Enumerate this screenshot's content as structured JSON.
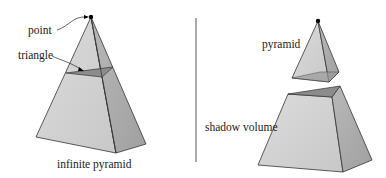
{
  "left_panel": {
    "labels": {
      "point": "point",
      "triangle": "triangle",
      "caption": "infinite pyramid"
    }
  },
  "right_panel": {
    "labels": {
      "pyramid": "pyramid",
      "shadow_volume": "shadow volume"
    }
  },
  "colors": {
    "face_light": "#d2d2d2",
    "face_dark": "#a9a9a9",
    "top_face": "#8c8c8c",
    "edge": "#333333",
    "divider": "#555555",
    "point": "#000000"
  }
}
